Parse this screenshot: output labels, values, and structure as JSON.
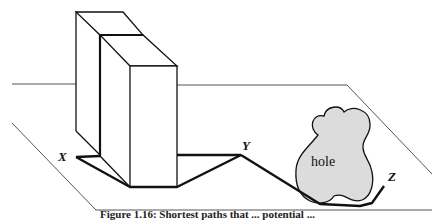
{
  "figure": {
    "labels": {
      "x": "X",
      "y": "Y",
      "z": "Z",
      "hole": "hole"
    },
    "caption": "Figure 1.16: Shortest paths that ... potential ...",
    "colors": {
      "stroke": "#111111",
      "plane": "#555555",
      "hole_fill": "#dcdcdc",
      "background": "#ffffff"
    }
  }
}
